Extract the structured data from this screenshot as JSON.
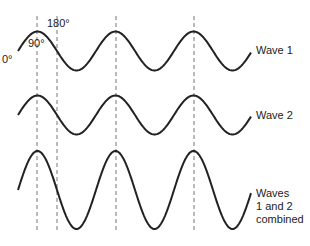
{
  "diagram": {
    "angle_labels": [
      "0°",
      "90°",
      "180°"
    ],
    "waves": [
      {
        "label": "Wave 1",
        "amplitude": 1
      },
      {
        "label": "Wave 2",
        "amplitude": 1
      },
      {
        "label": "Waves\n1 and 2\ncombined",
        "label_lines": [
          "Waves",
          "1 and 2",
          "combined"
        ],
        "amplitude": 2
      }
    ],
    "colors": {
      "wave": "#222222",
      "guide": "#777777",
      "background": "#ffffff"
    }
  }
}
